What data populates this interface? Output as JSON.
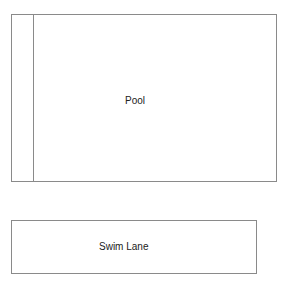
{
  "diagram": {
    "pool": {
      "label": "Pool"
    },
    "swim_lane": {
      "label": "Swim Lane"
    }
  }
}
